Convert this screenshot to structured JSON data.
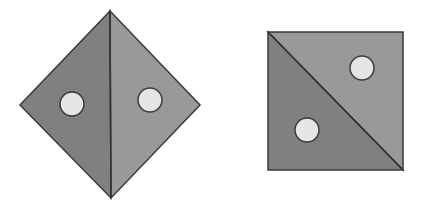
{
  "figure": {
    "colors": {
      "dark_fill": "#7e7e7e",
      "light_fill": "#9a9a9a",
      "stroke": "#3a3a3a",
      "hole_fill": "#e8e8e8"
    },
    "shapes": [
      {
        "name": "diamond",
        "holes": 2,
        "fold": "vertical"
      },
      {
        "name": "square",
        "holes": 2,
        "fold": "diagonal"
      }
    ]
  }
}
